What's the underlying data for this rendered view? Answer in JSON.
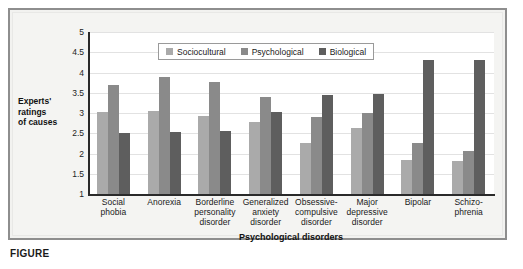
{
  "chart_data": {
    "type": "bar",
    "title": "",
    "xlabel": "Psychological disorders",
    "ylabel": "Experts' ratings of causes",
    "ylabel_lines": [
      "Experts'",
      "ratings",
      "of causes"
    ],
    "ylim": [
      1,
      5
    ],
    "yticks": [
      5,
      4.5,
      4,
      3.5,
      3,
      2.5,
      2,
      1.5,
      1
    ],
    "ytick_labels": [
      "5",
      "4.5",
      "4",
      "3.5",
      "3",
      "2.5",
      "2",
      "1.5",
      "1"
    ],
    "grid": true,
    "legend_position": "top-center",
    "categories": [
      "Social phobia",
      "Anorexia",
      "Borderline personality disorder",
      "Generalized anxiety disorder",
      "Obsessive-compulsive disorder",
      "Major depressive disorder",
      "Bipolar",
      "Schizophrenia"
    ],
    "category_lines": [
      [
        "Social",
        "phobia"
      ],
      [
        "Anorexia"
      ],
      [
        "Borderline",
        "personality",
        "disorder"
      ],
      [
        "Generalized",
        "anxiety",
        "disorder"
      ],
      [
        "Obsessive-",
        "compulsive",
        "disorder"
      ],
      [
        "Major",
        "depressive",
        "disorder"
      ],
      [
        "Bipolar"
      ],
      [
        "Schizo-",
        "phrenia"
      ]
    ],
    "series": [
      {
        "name": "Sociocultural",
        "color": "#aaaaaa",
        "values": [
          3.02,
          3.06,
          2.93,
          2.79,
          2.26,
          2.64,
          1.85,
          1.82
        ]
      },
      {
        "name": "Psychological",
        "color": "#8a8a8a",
        "values": [
          3.69,
          3.88,
          3.76,
          3.4,
          2.89,
          3.01,
          2.25,
          2.05
        ]
      },
      {
        "name": "Biological",
        "color": "#5e5e5e",
        "values": [
          2.51,
          2.54,
          2.56,
          3.02,
          3.45,
          3.47,
          4.3,
          4.32
        ]
      }
    ]
  },
  "caption": {
    "label": "FIGURE"
  }
}
